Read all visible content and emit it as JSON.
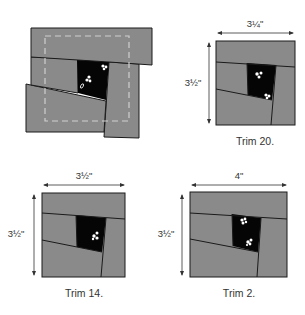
{
  "figure": {
    "colors": {
      "fabric_gray": "#8a8a8a",
      "center_black": "#050505",
      "outline": "#1a1a1a",
      "trim_line": "#cfcfcf"
    },
    "untrimmed_block": {
      "label": "",
      "has_dashed_trim_line": true
    },
    "panels": [
      {
        "id": "trim20",
        "caption": "Trim 20.",
        "width_label": "3¼\"",
        "height_label": "3½\""
      },
      {
        "id": "trim14",
        "caption": "Trim 14.",
        "width_label": "3½\"",
        "height_label": "3½\""
      },
      {
        "id": "trim2",
        "caption": "Trim 2.",
        "width_label": "4\"",
        "height_label": "3½\""
      }
    ]
  }
}
